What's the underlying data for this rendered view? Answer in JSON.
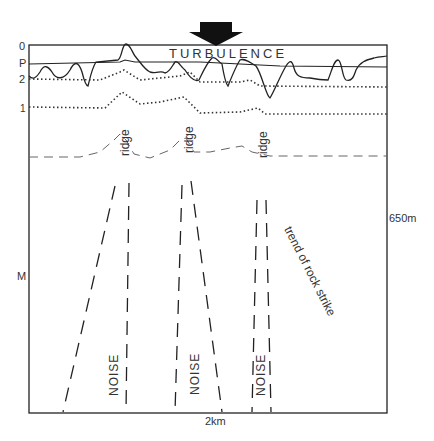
{
  "diagram": {
    "title_label": "TURBULENCE",
    "arrow_icon": "down-arrow-icon",
    "left_axis_labels": {
      "zero": "0",
      "p": "P",
      "two": "2",
      "one": "1",
      "m": "M"
    },
    "right_axis_label": "650m",
    "bottom_axis_label": "2km",
    "ridge_labels": [
      "ridge",
      "ridge",
      "ridge"
    ],
    "noise_labels": [
      "NOISE",
      "NOISE",
      "NOISE"
    ],
    "strike_label": "trend of rock strike",
    "colors": {
      "ink": "#222222",
      "dashed": "#555555",
      "background": "#ffffff"
    }
  }
}
